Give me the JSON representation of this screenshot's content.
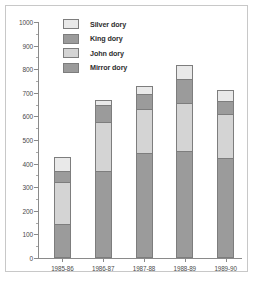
{
  "chart_data": {
    "type": "bar",
    "subtype": "stacked",
    "title": "",
    "xlabel": "",
    "ylabel": "",
    "categories": [
      "1985-86",
      "1986-87",
      "1987-88",
      "1988-89",
      "1989-90"
    ],
    "series": [
      {
        "name": "Mirror dory",
        "color": "#9b9b9b",
        "values": [
          145,
          370,
          447,
          455,
          425
        ]
      },
      {
        "name": "John dory",
        "color": "#d4d4d4",
        "values": [
          175,
          208,
          186,
          200,
          185
        ]
      },
      {
        "name": "King dory",
        "color": "#9b9b9b",
        "values": [
          50,
          72,
          60,
          102,
          57
        ]
      },
      {
        "name": "Silver dory",
        "color": "#e9e9e9",
        "values": [
          60,
          18,
          34,
          60,
          46
        ]
      }
    ],
    "totals": [
      430,
      668,
      727,
      817,
      713
    ],
    "ylim": [
      0,
      1000
    ],
    "y_ticks": [
      0,
      100,
      200,
      300,
      400,
      500,
      600,
      700,
      800,
      900,
      1000
    ],
    "y_tick_labels": [
      "0",
      "100",
      "200",
      "300",
      "400",
      "500",
      "600",
      "700",
      "800",
      "900",
      "1000"
    ],
    "grid": false,
    "legend_position": "top-left",
    "legend_entries": [
      "Silver dory",
      "King dory",
      "John dory",
      "Mirror dory"
    ],
    "axis_color": "#8a8a8a",
    "bar_border_color": "#7d7d7d",
    "frame_color": "#c8c8c8",
    "background": "#ffffff"
  }
}
